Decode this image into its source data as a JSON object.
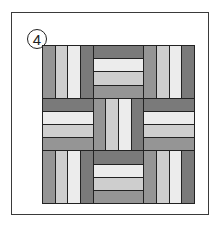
{
  "figure": {
    "badge_number": "4",
    "grid": {
      "rows": 3,
      "cols": 3
    },
    "blocks": [
      {
        "orientation": "vertical",
        "strips": [
          "med",
          "light",
          "pale",
          "dark"
        ]
      },
      {
        "orientation": "horizontal",
        "strips": [
          "dark",
          "pale",
          "light",
          "med"
        ]
      },
      {
        "orientation": "vertical",
        "strips": [
          "med",
          "light",
          "pale",
          "dark"
        ]
      },
      {
        "orientation": "horizontal",
        "strips": [
          "dark",
          "pale",
          "light",
          "med"
        ]
      },
      {
        "orientation": "vertical",
        "strips": [
          "med",
          "light",
          "pale",
          "dark"
        ]
      },
      {
        "orientation": "horizontal",
        "strips": [
          "dark",
          "pale",
          "light",
          "med"
        ]
      },
      {
        "orientation": "vertical",
        "strips": [
          "med",
          "light",
          "pale",
          "dark"
        ]
      },
      {
        "orientation": "horizontal",
        "strips": [
          "dark",
          "pale",
          "light",
          "med"
        ]
      },
      {
        "orientation": "vertical",
        "strips": [
          "med",
          "light",
          "pale",
          "dark"
        ]
      }
    ],
    "colors": {
      "med": "#a9a9a9",
      "light": "#e4e4e4",
      "pale": "#ececec",
      "dark": "#7a7a7a",
      "outline": "#222222"
    }
  }
}
